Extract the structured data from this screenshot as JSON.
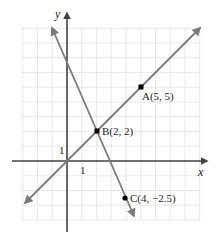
{
  "chart_data": {
    "type": "line",
    "title": "",
    "xlabel": "x",
    "ylabel": "y",
    "xlim": [
      -3,
      9
    ],
    "ylim": [
      -4,
      9
    ],
    "grid": true,
    "tick_labels": {
      "x": "1",
      "y": "1"
    },
    "series": [
      {
        "name": "line through A and B",
        "points": [
          [
            -2.5,
            -2.5
          ],
          [
            9,
            9
          ]
        ],
        "slope": 1,
        "intercept": 0
      },
      {
        "name": "line through B and C",
        "points": [
          [
            -0.5,
            8.5
          ],
          [
            4.5,
            -3.75
          ]
        ],
        "slope": -2.25,
        "intercept": 6.5
      }
    ],
    "points": [
      {
        "label": "A(5, 5)",
        "x": 5,
        "y": 5
      },
      {
        "label": "B(2, 2)",
        "x": 2,
        "y": 2
      },
      {
        "label": "C(4, −2.5)",
        "x": 4,
        "y": -2.5
      }
    ]
  },
  "labels": {
    "x_axis": "x",
    "y_axis": "y",
    "x_tick": "1",
    "y_tick": "1",
    "point_a": "A(5, 5)",
    "point_b": "B(2, 2)",
    "point_c": "C(4, −2.5)"
  },
  "colors": {
    "line": "#7a7a7a",
    "axis": "#555555",
    "grid": "#c8c8c8",
    "point": "#000000"
  }
}
